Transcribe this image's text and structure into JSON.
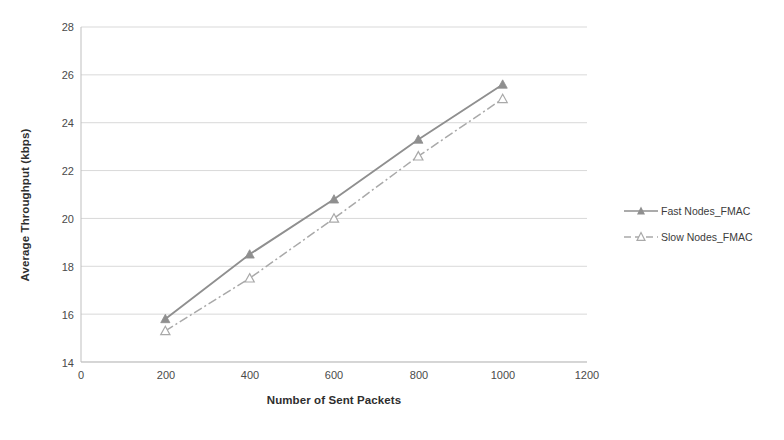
{
  "chart_data": {
    "type": "line",
    "title": "",
    "xlabel": "Number of Sent Packets",
    "ylabel": "Average Throughput (kbps)",
    "x": [
      200,
      400,
      600,
      800,
      1000
    ],
    "xlim": [
      0,
      1200
    ],
    "ylim": [
      14,
      28
    ],
    "xticks": [
      "0",
      "200",
      "400",
      "600",
      "800",
      "1000",
      "1200"
    ],
    "yticks": [
      "14",
      "16",
      "18",
      "20",
      "22",
      "24",
      "26",
      "28"
    ],
    "grid": "horizontal",
    "legend_position": "right",
    "series": [
      {
        "name": "Fast Nodes_FMAC",
        "values": [
          15.8,
          18.5,
          20.8,
          23.3,
          25.6
        ],
        "color": "#8f8f8f",
        "line_style": "solid",
        "marker": "filled-triangle"
      },
      {
        "name": "Slow Nodes_FMAC",
        "values": [
          15.3,
          17.5,
          20.0,
          22.6,
          25.0
        ],
        "color": "#a9a9a9",
        "line_style": "dash-dot",
        "marker": "open-triangle"
      }
    ]
  },
  "axes": {
    "grid_color": "#d9d9d9",
    "axis_color": "#bfbfbf",
    "plot_background": "#ffffff"
  }
}
